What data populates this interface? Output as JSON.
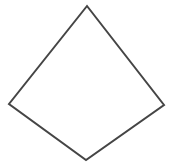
{
  "diagram": {
    "shape": "kite",
    "width": 173,
    "height": 163,
    "background": "#ffffff",
    "stroke_color": "#454545",
    "fill_color": "#ffffff",
    "stroke_width": 2,
    "vertices": {
      "top": [
        87,
        6
      ],
      "right": [
        164,
        105
      ],
      "bottom": [
        86,
        160
      ],
      "left": [
        9,
        104
      ]
    },
    "points": "87,6 164,105 86,160 9,104"
  }
}
